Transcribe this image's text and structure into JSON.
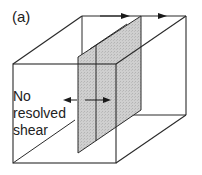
{
  "figure": {
    "panel_label": "(a)",
    "annotation": {
      "lines": [
        "No",
        "resolved",
        "shear"
      ]
    },
    "colors": {
      "line": "#2a2a2a",
      "plane_fill": "#c8c8c8",
      "background": "#ffffff"
    },
    "elements": {
      "box": "rectangular block in perspective",
      "plane": "shaded vertical plane through block",
      "arrows_top": [
        "left-pointing arrow on back-top edge",
        "right-pointing arrow on back-top edge"
      ],
      "arrows_middle": [
        "left-pointing arrow",
        "right-pointing arrow"
      ]
    }
  }
}
